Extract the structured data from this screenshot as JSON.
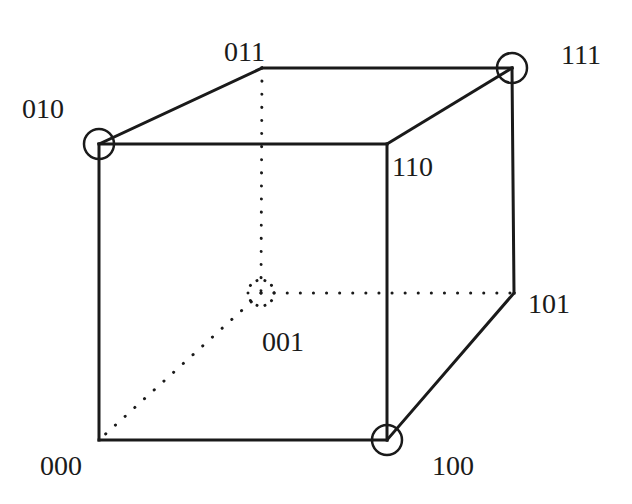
{
  "diagram": {
    "type": "binary-hypercube-3d",
    "colors": {
      "stroke": "#1a1a1a",
      "background": "#ffffff"
    },
    "vertices": [
      {
        "id": "000",
        "label": "000",
        "x": 99,
        "y": 440,
        "highlighted": false,
        "hidden": false,
        "label_pos": {
          "left": 40,
          "top": 452
        }
      },
      {
        "id": "100",
        "label": "100",
        "x": 387,
        "y": 440,
        "highlighted": true,
        "hidden": false,
        "label_pos": {
          "left": 432,
          "top": 452
        }
      },
      {
        "id": "110",
        "label": "110",
        "x": 387,
        "y": 144,
        "highlighted": false,
        "hidden": false,
        "label_pos": {
          "left": 392,
          "top": 153
        }
      },
      {
        "id": "010",
        "label": "010",
        "x": 99,
        "y": 144,
        "highlighted": true,
        "hidden": false,
        "label_pos": {
          "left": 22,
          "top": 95
        }
      },
      {
        "id": "011",
        "label": "011",
        "x": 262,
        "y": 68,
        "highlighted": false,
        "hidden": false,
        "label_pos": {
          "left": 224,
          "top": 38
        }
      },
      {
        "id": "111",
        "label": "111",
        "x": 512,
        "y": 68,
        "highlighted": true,
        "hidden": false,
        "label_pos": {
          "left": 561,
          "top": 41
        }
      },
      {
        "id": "101",
        "label": "101",
        "x": 514,
        "y": 293,
        "highlighted": false,
        "hidden": false,
        "label_pos": {
          "left": 528,
          "top": 290
        }
      },
      {
        "id": "001",
        "label": "001",
        "x": 261,
        "y": 293,
        "highlighted": true,
        "hidden": true,
        "label_pos": {
          "left": 262,
          "top": 328
        }
      }
    ],
    "edges": [
      {
        "from": "000",
        "to": "100",
        "style": "solid"
      },
      {
        "from": "100",
        "to": "110",
        "style": "solid"
      },
      {
        "from": "110",
        "to": "010",
        "style": "solid"
      },
      {
        "from": "010",
        "to": "000",
        "style": "solid"
      },
      {
        "from": "010",
        "to": "011",
        "style": "solid"
      },
      {
        "from": "011",
        "to": "111",
        "style": "solid"
      },
      {
        "from": "111",
        "to": "110",
        "style": "solid"
      },
      {
        "from": "111",
        "to": "101",
        "style": "solid"
      },
      {
        "from": "101",
        "to": "100",
        "style": "solid"
      },
      {
        "from": "011",
        "to": "001",
        "style": "dotted"
      },
      {
        "from": "001",
        "to": "101",
        "style": "dotted"
      },
      {
        "from": "001",
        "to": "000",
        "style": "dotted"
      }
    ]
  }
}
